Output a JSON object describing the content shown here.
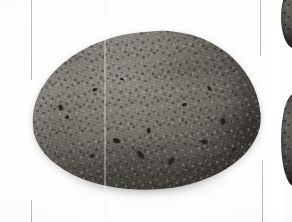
{
  "image": {
    "title": "Potato specimen photograph",
    "subject_label": "potato",
    "color_mode": "grayscale",
    "background_color": "#ffffff",
    "canvas": {
      "width": 292,
      "height": 222
    }
  },
  "subject": {
    "name": "potato-tuber",
    "description": "Single oblong potato tuber, russet skin, photographed on a plain white background",
    "skin_color": "#6e6a63",
    "shadow_color": "#9a9a9a",
    "highlight_color": "#8e8a83",
    "blemish_color": "#1d1b18",
    "bounds": {
      "left": 30,
      "top": 30,
      "width": 230,
      "height": 162
    },
    "blemishes": [
      {
        "left": 26,
        "top": 66,
        "width": 7,
        "height": 5
      },
      {
        "left": 33,
        "top": 77,
        "width": 5,
        "height": 4
      },
      {
        "left": 62,
        "top": 52,
        "width": 6,
        "height": 4
      },
      {
        "left": 78,
        "top": 104,
        "width": 9,
        "height": 6
      },
      {
        "left": 99,
        "top": 120,
        "width": 12,
        "height": 6
      },
      {
        "left": 112,
        "top": 96,
        "width": 7,
        "height": 5
      },
      {
        "left": 131,
        "top": 128,
        "width": 10,
        "height": 6
      },
      {
        "left": 150,
        "top": 74,
        "width": 6,
        "height": 4
      },
      {
        "left": 166,
        "top": 112,
        "width": 8,
        "height": 6
      },
      {
        "left": 176,
        "top": 60,
        "width": 6,
        "height": 4
      },
      {
        "left": 186,
        "top": 92,
        "width": 9,
        "height": 6
      },
      {
        "left": 196,
        "top": 122,
        "width": 7,
        "height": 5
      },
      {
        "left": 54,
        "top": 118,
        "width": 6,
        "height": 4
      },
      {
        "left": 90,
        "top": 44,
        "width": 5,
        "height": 3
      }
    ]
  },
  "artifacts": {
    "seam": {
      "name": "vertical-scan-seam",
      "left": 104,
      "description": "Faint light vertical seam from image stitching crossing the subject"
    },
    "guides": [
      {
        "name": "guide-top-left",
        "left": 31,
        "top": 0,
        "height": 80
      },
      {
        "name": "guide-top-right",
        "left": 260,
        "top": 0,
        "height": 56
      },
      {
        "name": "guide-bottom-left",
        "left": 31,
        "top": 200,
        "height": 22
      },
      {
        "name": "guide-bottom-right",
        "left": 262,
        "top": 160,
        "height": 62
      }
    ],
    "guide_color": "#b0b0b0"
  },
  "neighbors": [
    {
      "name": "cropped-specimen-top-right",
      "left": 281,
      "top": -14,
      "width": 26,
      "height": 62,
      "description": "Partially cropped dark tuber at the upper right edge"
    },
    {
      "name": "cropped-specimen-lower-right",
      "left": 281,
      "top": 94,
      "width": 26,
      "height": 92,
      "description": "Partially cropped dark tuber at the lower right edge"
    }
  ]
}
